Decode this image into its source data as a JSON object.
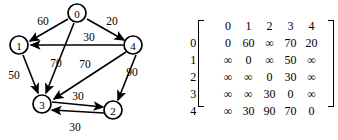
{
  "graph": {
    "title": "directed-weighted-graph",
    "nodes": [
      {
        "id": "0",
        "label": "0",
        "x": 77,
        "y": 13
      },
      {
        "id": "1",
        "label": "1",
        "x": 19,
        "y": 45
      },
      {
        "id": "2",
        "label": "2",
        "x": 113,
        "y": 110
      },
      {
        "id": "3",
        "label": "3",
        "x": 42,
        "y": 104
      },
      {
        "id": "4",
        "label": "4",
        "x": 133,
        "y": 45
      }
    ],
    "edges": [
      {
        "from": "0",
        "to": "1",
        "weight": "60",
        "label_x": 43,
        "label_y": 21
      },
      {
        "from": "0",
        "to": "4",
        "weight": "20",
        "label_x": 112,
        "label_y": 21
      },
      {
        "from": "0",
        "to": "3",
        "weight": "70",
        "label_x": 56,
        "label_y": 63
      },
      {
        "from": "4",
        "to": "1",
        "weight": "30",
        "label_x": 89,
        "label_y": 37
      },
      {
        "from": "4",
        "to": "3",
        "weight": "70",
        "label_x": 85,
        "label_y": 64
      },
      {
        "from": "4",
        "to": "2",
        "weight": "90",
        "label_x": 132,
        "label_y": 72
      },
      {
        "from": "1",
        "to": "3",
        "weight": "50",
        "label_x": 14,
        "label_y": 75
      },
      {
        "from": "3",
        "to": "2",
        "weight": "30",
        "label_x": 78,
        "label_y": 96
      },
      {
        "from": "2",
        "to": "3",
        "weight": "30",
        "label_x": 75,
        "label_y": 127
      }
    ]
  },
  "matrix": {
    "name": "adjacency-cost-matrix",
    "column_headers": [
      "0",
      "1",
      "2",
      "3",
      "4"
    ],
    "row_headers": [
      "0",
      "1",
      "2",
      "3",
      "4"
    ],
    "rows": [
      [
        "0",
        "60",
        "∞",
        "70",
        "20"
      ],
      [
        "∞",
        "0",
        "∞",
        "50",
        "∞"
      ],
      [
        "∞",
        "∞",
        "0",
        "30",
        "∞"
      ],
      [
        "∞",
        "∞",
        "30",
        "0",
        "∞"
      ],
      [
        "∞",
        "30",
        "90",
        "70",
        "0"
      ]
    ]
  },
  "colors": {
    "ink": "#000000",
    "background": "#ffffff"
  }
}
